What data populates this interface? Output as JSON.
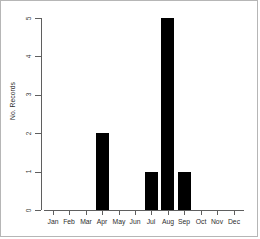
{
  "chart_data": {
    "type": "bar",
    "title": "",
    "xlabel": "",
    "ylabel": "No. Records",
    "categories": [
      "Jan",
      "Feb",
      "Mar",
      "Apr",
      "May",
      "Jun",
      "Jul",
      "Aug",
      "Sep",
      "Oct",
      "Nov",
      "Dec"
    ],
    "values": [
      0,
      0,
      0,
      2,
      0,
      0,
      1,
      5,
      1,
      0,
      0,
      0
    ],
    "ylim": [
      0,
      5
    ],
    "yticks": [
      "0",
      "1",
      "2",
      "3",
      "4",
      "5"
    ],
    "ytick_values": [
      0,
      1,
      2,
      3,
      4,
      5
    ],
    "grid": false,
    "legend": null,
    "bar_color": "#000000",
    "axis_color": "#5f5f5f",
    "frame_color": "#b6b6b6",
    "background": "#ffffff"
  }
}
